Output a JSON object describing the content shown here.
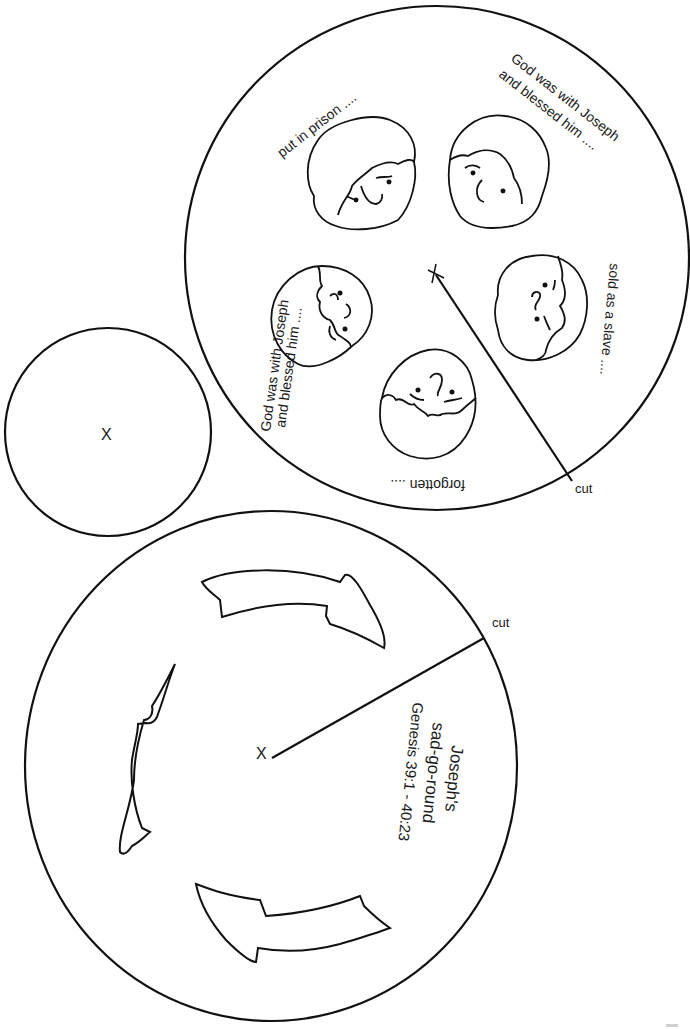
{
  "colors": {
    "ink": "#111111",
    "paper": "#ffffff"
  },
  "top_wheel": {
    "center_mark": "x",
    "cut_label": "cut",
    "captions": [
      {
        "id": "put-in-prison",
        "text": "put in prison ...."
      },
      {
        "id": "god-with-1-line1",
        "text": "God was with Joseph"
      },
      {
        "id": "god-with-1-line2",
        "text": "and blessed him ...."
      },
      {
        "id": "sold-as-slave",
        "text": "sold as a slave ...."
      },
      {
        "id": "forgotten",
        "text": "forgotten ...."
      },
      {
        "id": "god-with-2-line1",
        "text": "God was with Joseph"
      },
      {
        "id": "god-with-2-line2",
        "text": "and blessed him ...."
      }
    ],
    "faces": [
      "sad-face-prison",
      "happy-face-blessed",
      "sad-face-slave",
      "sad-face-forgotten",
      "happy-face-blessed-2"
    ]
  },
  "small_circle": {
    "center_mark": "X"
  },
  "bottom_wheel": {
    "center_mark": "X",
    "cut_label": "cut",
    "title_line1": "Joseph's",
    "title_line2": "sad-go-round",
    "reference": "Genesis 39:1 - 40:23",
    "arrows": [
      "arrow-top",
      "arrow-left",
      "arrow-bottom"
    ]
  }
}
